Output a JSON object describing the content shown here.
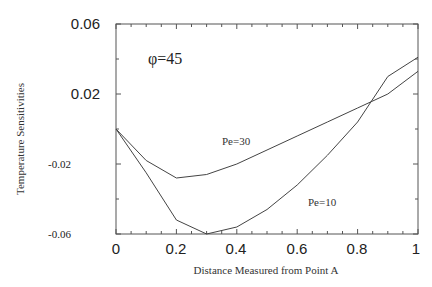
{
  "chart_data": {
    "type": "line",
    "title": "",
    "xlabel": "Distance Measured from Point A",
    "ylabel": "Temperature Sensitivities",
    "xlim": [
      0,
      1
    ],
    "ylim": [
      -0.06,
      0.06
    ],
    "x_ticks": [
      "0",
      "0.2",
      "0.4",
      "0.6",
      "0.8",
      "1"
    ],
    "y_ticks": [
      "0.06",
      "0.02",
      "-0.02",
      "-0.06"
    ],
    "grid": false,
    "legend": "none (inline labels)",
    "annotations": [
      "φ=45",
      "Pe=30",
      "Pe=10"
    ],
    "x": [
      0,
      0.1,
      0.2,
      0.3,
      0.4,
      0.5,
      0.6,
      0.7,
      0.8,
      0.9,
      1.0
    ],
    "series": [
      {
        "name": "Pe=30",
        "values": [
          0.0,
          -0.018,
          -0.028,
          -0.026,
          -0.02,
          -0.012,
          -0.004,
          0.004,
          0.012,
          0.02,
          0.033
        ]
      },
      {
        "name": "Pe=10",
        "values": [
          0.0,
          -0.025,
          -0.052,
          -0.06,
          -0.056,
          -0.046,
          -0.032,
          -0.015,
          0.004,
          0.03,
          0.041
        ]
      }
    ]
  },
  "labels": {
    "phi": "φ=45",
    "pe30": "Pe=30",
    "pe10": "Pe=10",
    "xlabel": "Distance Measured from Point A",
    "ylabel": "Temperature Sensitivities",
    "yt0": "0.06",
    "yt1": "0.02",
    "yt2": "-0.02",
    "yt3": "-0.06",
    "xt0": "0",
    "xt1": "0.2",
    "xt2": "0.4",
    "xt3": "0.6",
    "xt4": "0.8",
    "xt5": "1"
  }
}
